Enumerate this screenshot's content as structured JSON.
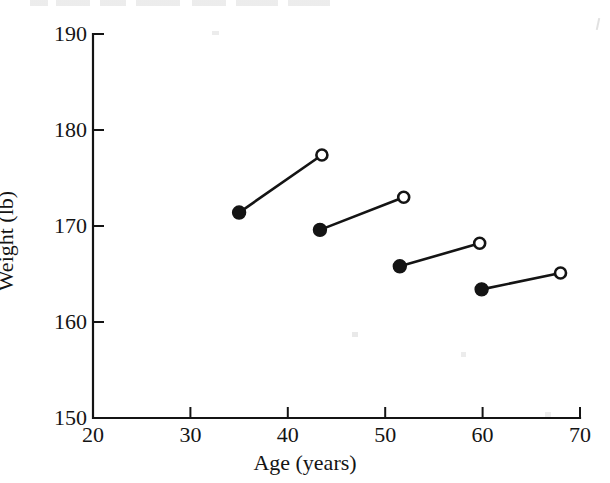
{
  "figure": {
    "background_color": "#ffffff",
    "ink_color": "#141414",
    "has_visible_title": false
  },
  "chart_data": {
    "type": "scatter",
    "title": "",
    "subtitle": "",
    "xlabel": "Age (years)",
    "ylabel": "Weight (lb)",
    "xlim": [
      20,
      70
    ],
    "ylim": [
      150,
      190
    ],
    "xticks": [
      20,
      30,
      40,
      50,
      60,
      70
    ],
    "yticks": [
      150,
      160,
      170,
      180,
      190
    ],
    "xtick_labels": [
      "20",
      "30",
      "40",
      "50",
      "60",
      "70"
    ],
    "ytick_labels": [
      "150",
      "160",
      "170",
      "180",
      "190"
    ],
    "grid": false,
    "legend": false,
    "legend_position": "none",
    "annotations": [],
    "marker_styles": {
      "filled": {
        "name": "filled-circle",
        "fill": "#141414",
        "stroke": "#141414",
        "radius_px": 7
      },
      "open": {
        "name": "open-circle",
        "fill": "#ffffff",
        "stroke": "#141414",
        "radius_px": 7
      }
    },
    "connector_style": {
      "stroke": "#141414",
      "width_px": 2.6
    },
    "series": [
      {
        "name": "Baseline (filled circles)",
        "marker": "filled",
        "x": [
          35.0,
          43.3,
          51.5,
          59.9
        ],
        "y": [
          171.4,
          169.6,
          165.8,
          163.4
        ]
      },
      {
        "name": "Follow-up (open circles)",
        "marker": "open",
        "x": [
          43.5,
          51.9,
          59.7,
          68.0
        ],
        "y": [
          177.4,
          173.0,
          168.2,
          165.1
        ]
      }
    ],
    "pairs": [
      {
        "label": "cohort-1",
        "start": {
          "x": 35.0,
          "y": 171.4,
          "marker": "filled"
        },
        "end": {
          "x": 43.5,
          "y": 177.4,
          "marker": "open"
        }
      },
      {
        "label": "cohort-2",
        "start": {
          "x": 43.3,
          "y": 169.6,
          "marker": "filled"
        },
        "end": {
          "x": 51.9,
          "y": 173.0,
          "marker": "open"
        }
      },
      {
        "label": "cohort-3",
        "start": {
          "x": 51.5,
          "y": 165.8,
          "marker": "filled"
        },
        "end": {
          "x": 59.7,
          "y": 168.2,
          "marker": "open"
        }
      },
      {
        "label": "cohort-4",
        "start": {
          "x": 59.9,
          "y": 163.4,
          "marker": "filled"
        },
        "end": {
          "x": 68.0,
          "y": 165.1,
          "marker": "open"
        }
      }
    ]
  }
}
